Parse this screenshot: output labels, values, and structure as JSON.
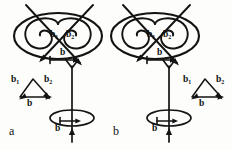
{
  "figure": {
    "width": 232,
    "height": 150,
    "background_color": "#fdfdfb",
    "ink_color": "#131313",
    "type": "line-drawing"
  },
  "panels": [
    {
      "id": "a",
      "caption": "a",
      "loop": {
        "labels": {
          "b1": "b",
          "b1_sub": "1",
          "b2": "b",
          "b2_sub": "2",
          "b": "b"
        }
      },
      "triangle": {
        "labels": {
          "b1": "b",
          "b1_sub": "1",
          "b2": "b",
          "b2_sub": "2",
          "b": "b"
        }
      },
      "helix": {
        "labels": {
          "b": "b"
        }
      }
    },
    {
      "id": "b",
      "caption": "b",
      "loop": {
        "labels": {
          "b1": "b",
          "b1_sub": "1",
          "b2": "b",
          "b2_sub": "2",
          "b": "b"
        }
      },
      "triangle": {
        "labels": {
          "b1": "b",
          "b1_sub": "1",
          "b2": "b",
          "b2_sub": "2",
          "b": "b"
        }
      },
      "helix": {
        "labels": {
          "b": "b"
        }
      }
    }
  ]
}
